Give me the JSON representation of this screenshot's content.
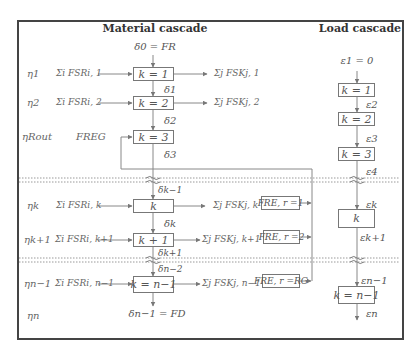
{
  "headers": {
    "material": "Material cascade",
    "load": "Load cascade"
  },
  "material": {
    "input_top": "δ0 = FR",
    "output_bottom": "δn−1 = FD",
    "boxes": [
      {
        "label": "k = 1"
      },
      {
        "label": "k = 2"
      },
      {
        "label": "k = 3"
      },
      {
        "label": "k"
      },
      {
        "label": "k + 1"
      },
      {
        "label": "k = n−1"
      }
    ],
    "deltas": [
      "δ1",
      "δ2",
      "δ3",
      "δk−1",
      "δk",
      "δk+1",
      "δn−2"
    ],
    "rows": [
      {
        "eta": "η1",
        "input": "Σi FSRi, 1",
        "output": "Σj FSKj, 1"
      },
      {
        "eta": "η2",
        "input": "Σi FSRi, 2",
        "output": "Σj FSKj, 2"
      },
      {
        "eta": "ηRout",
        "input": "FREG",
        "output": ""
      },
      {
        "eta": "ηk",
        "input": "Σi FSRi, k",
        "output": "Σj FSKj, k +",
        "fre": "FRE, r =1"
      },
      {
        "eta": "ηk+1",
        "input": "Σi FSRi, k+1",
        "output": "Σj FSKj, k+1 +",
        "fre": "FRE, r =2"
      },
      {
        "eta": "ηn−1",
        "input": "Σi FSRi, n−1",
        "output": "Σj FSKj, n−1 +",
        "fre": "FRE, r =RG"
      },
      {
        "eta": "ηn",
        "input": "",
        "output": ""
      }
    ]
  },
  "load": {
    "input_top": "ε1 = 0",
    "boxes": [
      {
        "label": "k = 1"
      },
      {
        "label": "k = 2"
      },
      {
        "label": "k = 3"
      },
      {
        "label": "k"
      },
      {
        "label": "k = n−1"
      }
    ],
    "epsilons": [
      "ε2",
      "ε3",
      "ε4",
      "εk",
      "εk+1",
      "εn−1",
      "εn"
    ]
  },
  "colors": {
    "frame": "#444444",
    "lines": "#888888",
    "text": "#555555"
  }
}
